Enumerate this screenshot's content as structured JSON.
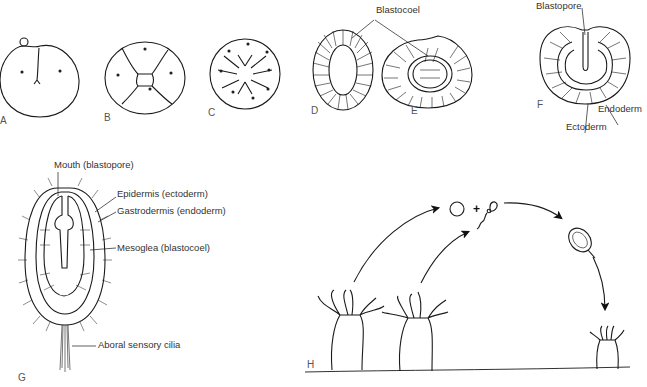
{
  "figure": {
    "panels": [
      {
        "id": "A",
        "label": "A",
        "stage": "2-cell"
      },
      {
        "id": "B",
        "label": "B",
        "stage": "4-cell"
      },
      {
        "id": "C",
        "label": "C",
        "stage": "8-cell"
      },
      {
        "id": "D",
        "label": "D",
        "stage": "blastula"
      },
      {
        "id": "E",
        "label": "E",
        "stage": "early gastrula"
      },
      {
        "id": "F",
        "label": "F",
        "stage": "gastrula"
      },
      {
        "id": "G",
        "label": "G",
        "stage": "planula larva"
      },
      {
        "id": "H",
        "label": "H",
        "stage": "life cycle"
      }
    ],
    "annotations": {
      "blastocoel": "Blastocoel",
      "blastopore": "Blastopore",
      "endoderm": "Endoderm",
      "ectoderm": "Ectoderm",
      "mouth": "Mouth (blastopore)",
      "epidermis": "Epidermis (ectoderm)",
      "gastrodermis": "Gastrodermis (endoderm)",
      "mesoglea": "Mesoglea (blastocoel)",
      "aboral": "Aboral sensory cilia",
      "plus": "+"
    },
    "colors": {
      "line": "#1a1a1a",
      "text": "#333333",
      "background": "#ffffff"
    }
  }
}
